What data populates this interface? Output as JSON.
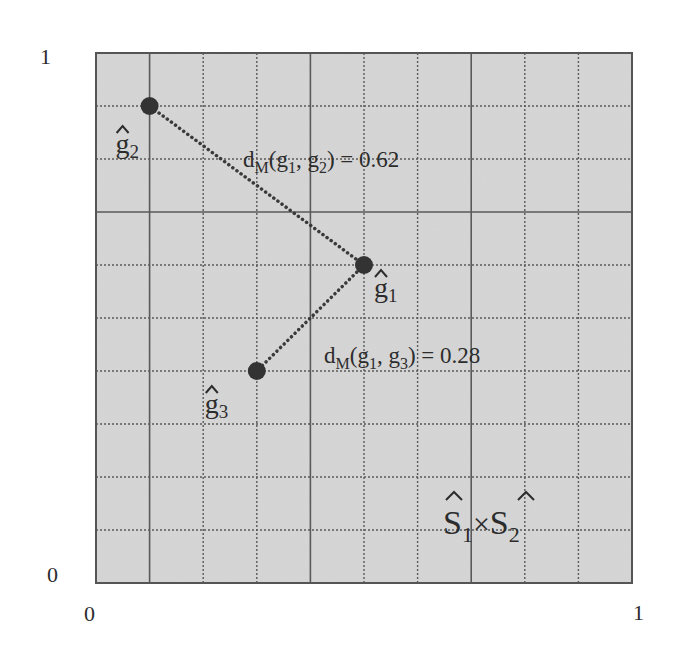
{
  "chart_data": {
    "type": "scatter",
    "title": "",
    "xlabel": "",
    "ylabel": "",
    "xlim": [
      0,
      1
    ],
    "ylim": [
      0,
      1
    ],
    "grid": true,
    "grid_step": 0.1,
    "x_tick_labels": [
      "0",
      "1"
    ],
    "y_tick_labels": [
      "0",
      "1"
    ],
    "region_label": {
      "base1": "S",
      "sub1": "1",
      "times": "×",
      "base2": "S",
      "sub2": "2",
      "hat": true
    },
    "points": [
      {
        "id": "g1",
        "name": "ĝ1",
        "base": "g",
        "sub": "1",
        "x": 0.5,
        "y": 0.6
      },
      {
        "id": "g2",
        "name": "ĝ2",
        "base": "g",
        "sub": "2",
        "x": 0.1,
        "y": 0.9
      },
      {
        "id": "g3",
        "name": "ĝ3",
        "base": "g",
        "sub": "3",
        "x": 0.3,
        "y": 0.4
      }
    ],
    "connections": [
      {
        "from": "g1",
        "to": "g2",
        "style": "dotted",
        "label": {
          "d": "d",
          "dsub": "M",
          "a": "g",
          "asub": "1",
          "b": "g",
          "bsub": "2",
          "value": "0.62"
        }
      },
      {
        "from": "g1",
        "to": "g3",
        "style": "dotted",
        "label": {
          "d": "d",
          "dsub": "M",
          "a": "g",
          "asub": "1",
          "b": "g",
          "bsub": "3",
          "value": "0.28"
        }
      }
    ],
    "colors": {
      "background": "#d6d6d6",
      "grid": "#5a5a5a",
      "points": "#333333",
      "text": "#2c2c2c"
    }
  }
}
